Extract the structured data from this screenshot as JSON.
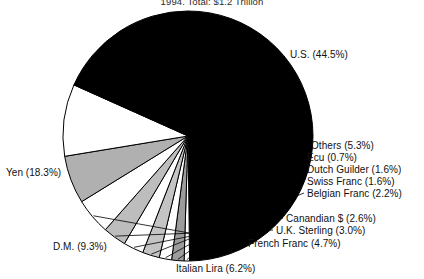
{
  "chart_data": {
    "type": "pie",
    "title": "1994, Total: $1.2 Trillion",
    "xlabel": "",
    "ylabel": "",
    "legend_position": "none",
    "grid": false,
    "units": "percent",
    "start_angle_deg": 0,
    "direction": "clockwise",
    "categories": [
      "U.S.",
      "Others",
      "Ecu",
      "Dutch Guilder",
      "Swiss Franc",
      "Belgian Franc",
      "Canandian $",
      "U.K. Sterling",
      "French Franc",
      "Italian Lira",
      "D.M.",
      "Yen"
    ],
    "values": [
      44.5,
      5.3,
      0.7,
      1.6,
      1.6,
      2.2,
      2.6,
      3.0,
      4.7,
      6.2,
      9.3,
      18.3
    ],
    "slices": [
      {
        "label": "U.S. (44.5%)",
        "name": "U.S.",
        "value": 44.5,
        "fill": "#000000"
      },
      {
        "label": "Others (5.3%)",
        "name": "Others",
        "value": 5.3,
        "fill": "#000000"
      },
      {
        "label": "Ecu (0.7%)",
        "name": "Ecu",
        "value": 0.7,
        "fill": "#ffffff"
      },
      {
        "label": "Dutch Guilder (1.6%)",
        "name": "Dutch Guilder",
        "value": 1.6,
        "fill": "#9c9c9c"
      },
      {
        "label": "Swiss Franc (1.6%)",
        "name": "Swiss Franc",
        "value": 1.6,
        "fill": "#ffffff"
      },
      {
        "label": "Belgian Franc (2.2%)",
        "name": "Belgian Franc",
        "value": 2.2,
        "fill": "#c4c4c4"
      },
      {
        "label": "Canandian $ (2.6%)",
        "name": "Canandian $",
        "value": 2.6,
        "fill": "#ffffff"
      },
      {
        "label": "U.K. Sterling (3.0%)",
        "name": "U.K. Sterling",
        "value": 3.0,
        "fill": "#bdbdbd"
      },
      {
        "label": "French Franc (4.7%)",
        "name": "French Franc",
        "value": 4.7,
        "fill": "#ffffff"
      },
      {
        "label": "Italian Lira (6.2%)",
        "name": "Italian Lira",
        "value": 6.2,
        "fill": "#b0b0b0"
      },
      {
        "label": "D.M. (9.3%)",
        "name": "D.M.",
        "value": 9.3,
        "fill": "#ffffff"
      },
      {
        "label": "Yen (18.3%)",
        "name": "Yen",
        "value": 18.3,
        "fill": "#000000"
      }
    ],
    "labels": {
      "us": "U.S. (44.5%)",
      "others": "Others (5.3%)",
      "ecu": "Ecu (0.7%)",
      "dutch_guilder": "Dutch Guilder (1.6%)",
      "swiss_franc": "Swiss Franc (1.6%)",
      "belgian_franc": "Belgian Franc (2.2%)",
      "canadian_dollar": "Canandian $ (2.6%)",
      "uk_sterling": "U.K. Sterling (3.0%)",
      "french_franc": "French Franc (4.7%)",
      "italian_lira": "Italian Lira (6.2%)",
      "dm": "D.M. (9.3%)",
      "yen": "Yen (18.3%)"
    },
    "geometry": {
      "center_x": 188,
      "center_y": 136,
      "radius": 125
    },
    "colors": {
      "background": "#ffffff",
      "outline": "#000000",
      "dark": "#000000",
      "light": "#ffffff",
      "gray_mid": "#b0b0b0",
      "gray_dark": "#9c9c9c",
      "text": "#111111"
    }
  }
}
